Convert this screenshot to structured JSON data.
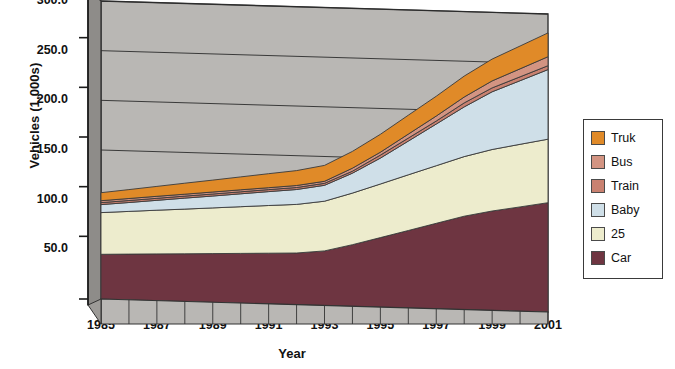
{
  "chart_data": {
    "type": "area",
    "stacked": true,
    "title": "",
    "xlabel": "Year",
    "ylabel": "Vehicles (1,000s)",
    "x": [
      1985,
      1986,
      1987,
      1988,
      1989,
      1990,
      1991,
      1992,
      1993,
      1994,
      1995,
      1996,
      1997,
      1998,
      1999,
      2000,
      2001
    ],
    "xtick_labels": [
      "1985",
      "1987",
      "1989",
      "1991",
      "1993",
      "1995",
      "1997",
      "1999",
      "2001"
    ],
    "xtick_values": [
      1985,
      1987,
      1989,
      1991,
      1993,
      1995,
      1997,
      1999,
      2001
    ],
    "ytick_labels": [
      "50.0",
      "100.0",
      "150.0",
      "200.0",
      "250.0",
      "300.0"
    ],
    "ytick_values": [
      50,
      100,
      150,
      200,
      250,
      300
    ],
    "ylim": [
      0,
      300
    ],
    "xlim": [
      1985,
      2001
    ],
    "grid": true,
    "grid_axis": "y",
    "legend_position": "right",
    "plot_background": "#b9b7b4",
    "series": [
      {
        "name": "Car",
        "color": "#6e3541",
        "values": [
          45,
          46,
          47,
          48,
          49,
          50,
          51,
          52,
          55,
          62,
          70,
          78,
          86,
          94,
          100,
          105,
          110
        ]
      },
      {
        "name": "25",
        "color": "#edeccd",
        "values": [
          42,
          43,
          44,
          45,
          46,
          47,
          48,
          49,
          50,
          52,
          54,
          56,
          58,
          60,
          62,
          63,
          64
        ]
      },
      {
        "name": "Baby",
        "color": "#cfdfe8",
        "values": [
          8,
          9,
          10,
          11,
          12,
          13,
          14,
          15,
          16,
          20,
          26,
          34,
          42,
          50,
          58,
          64,
          70
        ]
      },
      {
        "name": "Train",
        "color": "#c98170",
        "values": [
          2,
          2,
          2,
          2,
          2,
          2,
          2,
          2,
          2,
          2,
          3,
          3,
          3,
          4,
          4,
          4,
          4
        ]
      },
      {
        "name": "Bus",
        "color": "#d39482",
        "values": [
          2,
          2,
          2,
          2,
          2,
          2,
          2,
          2,
          2,
          3,
          3,
          4,
          5,
          6,
          7,
          8,
          9
        ]
      },
      {
        "name": "Truk",
        "color": "#e08a28",
        "values": [
          8,
          9,
          10,
          11,
          12,
          13,
          14,
          15,
          16,
          17,
          18,
          19,
          20,
          21,
          22,
          23,
          24
        ]
      }
    ],
    "series_order_bottom_to_top": [
      "Car",
      "25",
      "Baby",
      "Train",
      "Bus",
      "Truk"
    ]
  },
  "legend": {
    "items": [
      {
        "label": "Truk",
        "color": "#e08a28"
      },
      {
        "label": "Bus",
        "color": "#d39482"
      },
      {
        "label": "Train",
        "color": "#c98170"
      },
      {
        "label": "Baby",
        "color": "#cfdfe8"
      },
      {
        "label": "25",
        "color": "#edeccd"
      },
      {
        "label": "Car",
        "color": "#6e3541"
      }
    ]
  },
  "axes": {
    "y_title": "Vehicles (1,000s)",
    "x_title": "Year"
  }
}
